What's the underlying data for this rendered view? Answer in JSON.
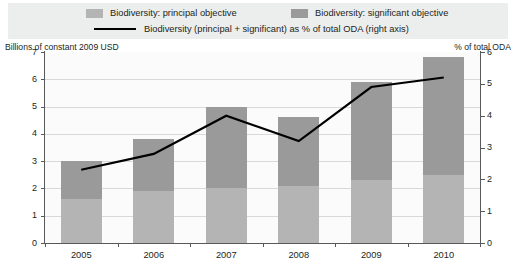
{
  "legend": {
    "items": [
      {
        "label": "Biodiversity: principal objective",
        "marker": "swatch",
        "color": "#b4b4b4",
        "name": "legend-principal"
      },
      {
        "label": "Biodiversity: significant objective",
        "marker": "swatch",
        "color": "#9a9a9a",
        "name": "legend-significant"
      },
      {
        "label": "Biodiversity (principal + significant) as % of total ODA (right axis)",
        "marker": "line",
        "color": "#000000",
        "name": "legend-percent-line"
      }
    ],
    "band_color": "#eceded"
  },
  "axis_captions": {
    "left": "Billions of constant 2009 USD",
    "right": "% of total ODA"
  },
  "chart_data": {
    "type": "bar",
    "title": "",
    "subtitle": "",
    "xlabel": "",
    "ylabel": "Billions of constant 2009 USD",
    "y2label": "% of total ODA",
    "categories": [
      "2005",
      "2006",
      "2007",
      "2008",
      "2009",
      "2010"
    ],
    "ylim": [
      0,
      7
    ],
    "y2lim": [
      0,
      6
    ],
    "yticks": [
      "0",
      "1",
      "2",
      "3",
      "4",
      "5",
      "6",
      "7"
    ],
    "y2ticks": [
      "0",
      "1",
      "2",
      "3",
      "4",
      "5",
      "6"
    ],
    "grid": true,
    "legend_position": "top",
    "stacked": true,
    "series": [
      {
        "name": "Biodiversity: principal objective",
        "type": "bar",
        "color": "#b4b4b4",
        "axis": "left",
        "values": [
          1.6,
          1.9,
          2.0,
          2.1,
          2.3,
          2.5
        ]
      },
      {
        "name": "Biodiversity: significant objective",
        "type": "bar",
        "color": "#9a9a9a",
        "axis": "left",
        "values": [
          1.4,
          1.9,
          3.0,
          2.5,
          3.6,
          4.3
        ]
      },
      {
        "name": "Biodiversity (principal + significant) as % of total ODA (right axis)",
        "type": "line",
        "color": "#000000",
        "axis": "right",
        "values": [
          2.3,
          2.8,
          4.0,
          3.2,
          4.9,
          5.2
        ]
      }
    ],
    "totals": [
      3.0,
      3.8,
      5.0,
      4.6,
      5.9,
      6.8
    ]
  },
  "source": ""
}
